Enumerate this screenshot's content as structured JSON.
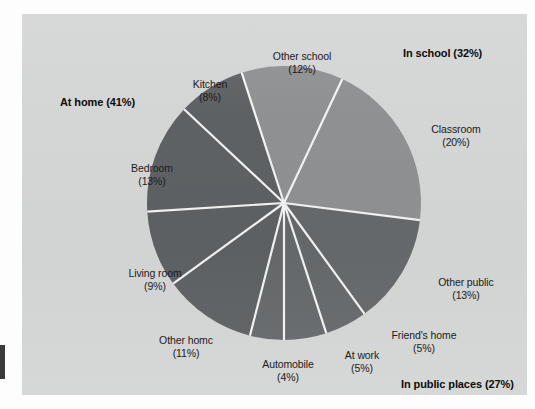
{
  "chart_data": {
    "type": "pie",
    "title": "",
    "subtitle": "",
    "xlabel": "",
    "ylabel": "",
    "legend_position": "none",
    "grid": false,
    "units": "percent",
    "total": 100,
    "categories": [
      "Other school",
      "Classroom",
      "Other public",
      "Friend's home",
      "At work",
      "Automobile",
      "Other homc",
      "Living room",
      "Bedroom",
      "Kitchen"
    ],
    "values": [
      12,
      20,
      13,
      5,
      5,
      4,
      11,
      9,
      13,
      8
    ],
    "slices": [
      {
        "label": "Other school",
        "percent": 12,
        "percent_text": "(12%)",
        "group": "In school",
        "color": "#8e9091",
        "start_angle": -18,
        "end_angle": 25.2
      },
      {
        "label": "Classroom",
        "percent": 20,
        "percent_text": "(20%)",
        "group": "In school",
        "color": "#8e9091",
        "start_angle": 25.2,
        "end_angle": 97.2
      },
      {
        "label": "Other public",
        "percent": 13,
        "percent_text": "(13%)",
        "group": "In public places",
        "color": "#66696b",
        "start_angle": 97.2,
        "end_angle": 144
      },
      {
        "label": "Friend's home",
        "percent": 5,
        "percent_text": "(5%)",
        "group": "In public places",
        "color": "#66696b",
        "start_angle": 144,
        "end_angle": 162
      },
      {
        "label": "At work",
        "percent": 5,
        "percent_text": "(5%)",
        "group": "In public places",
        "color": "#66696b",
        "start_angle": 162,
        "end_angle": 180
      },
      {
        "label": "Automobile",
        "percent": 4,
        "percent_text": "(4%)",
        "group": "In public places",
        "color": "#66696b",
        "start_angle": 180,
        "end_angle": 194.4
      },
      {
        "label": "Other homc",
        "percent": 11,
        "percent_text": "(11%)",
        "group": "At home",
        "color": "#5e6163",
        "start_angle": 194.4,
        "end_angle": 234
      },
      {
        "label": "Living room",
        "percent": 9,
        "percent_text": "(9%)",
        "group": "At home",
        "color": "#5e6163",
        "start_angle": 234,
        "end_angle": 266.4
      },
      {
        "label": "Bedroom",
        "percent": 13,
        "percent_text": "(13%)",
        "group": "At home",
        "color": "#5e6163",
        "start_angle": 266.4,
        "end_angle": 313.2
      },
      {
        "label": "Kitchen",
        "percent": 8,
        "percent_text": "(8%)",
        "group": "At home",
        "color": "#5e6163",
        "start_angle": 313.2,
        "end_angle": 342
      }
    ],
    "groups": [
      {
        "name": "At home",
        "percent": 41,
        "label": "At home (41%)",
        "color": "#5e6163"
      },
      {
        "name": "In school",
        "percent": 32,
        "label": "In school (32%)",
        "color": "#8e9091"
      },
      {
        "name": "In public places",
        "percent": 27,
        "label": "In public places (27%)",
        "color": "#66696b"
      }
    ]
  },
  "chart": {
    "background": "#d4d5d5",
    "separator_color": "#f2f2f2",
    "labels": {
      "other_school": {
        "name": "Other school",
        "pct": "(12%)"
      },
      "kitchen": {
        "name": "Kitchen",
        "pct": "(8%)"
      },
      "classroom": {
        "name": "Classroom",
        "pct": "(20%)"
      },
      "bedroom": {
        "name": "Bedroom",
        "pct": "(13%)"
      },
      "living_room": {
        "name": "Living room",
        "pct": "(9%)"
      },
      "other_public": {
        "name": "Other public",
        "pct": "(13%)"
      },
      "other_home": {
        "name": "Other homc",
        "pct": "(11%)"
      },
      "automobile": {
        "name": "Automobile",
        "pct": "(4%)"
      },
      "at_work": {
        "name": "At work",
        "pct": "(5%)"
      },
      "friends_home": {
        "name": "Friend's home",
        "pct": "(5%)"
      }
    },
    "group_labels": {
      "at_home": "At home (41%)",
      "in_school": "In school (32%)",
      "in_public_places": "In public places (27%)"
    }
  }
}
